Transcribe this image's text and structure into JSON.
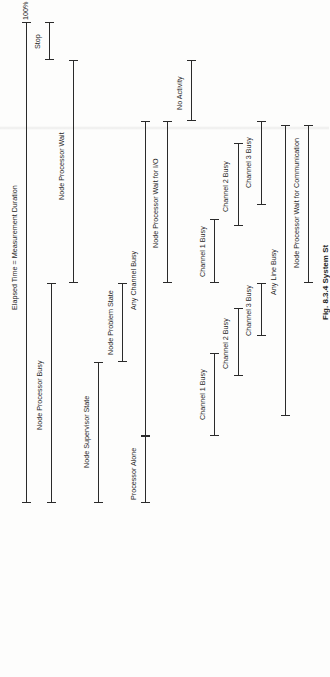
{
  "figure": {
    "caption": "Fig. 8.3.4  System St",
    "top_marker": "100%"
  },
  "bars": [
    {
      "id": "elapsed",
      "label": "Elapsed Time = Measurement Duration",
      "x": 26,
      "y1": 22,
      "y2": 503,
      "label_x": 15,
      "label_y": 310
    },
    {
      "id": "stop",
      "label": "Stop",
      "x": 49,
      "y1": 22,
      "y2": 60,
      "label_x": 38,
      "label_y": 49
    },
    {
      "id": "node-processor-busy",
      "label": "Node Processor Busy",
      "x": 51,
      "y1": 283,
      "y2": 503,
      "label_x": 40,
      "label_y": 430
    },
    {
      "id": "node-processor-wait",
      "label": "Node Processor Wait",
      "x": 73,
      "y1": 60,
      "y2": 283,
      "label_x": 62,
      "label_y": 200
    },
    {
      "id": "node-supervisor-state",
      "label": "Node Supervisor State",
      "x": 98,
      "y1": 362,
      "y2": 503,
      "label_x": 87,
      "label_y": 468
    },
    {
      "id": "node-problem-state",
      "label": "Node Problem State",
      "x": 122,
      "y1": 283,
      "y2": 362,
      "label_x": 111,
      "label_y": 355
    },
    {
      "id": "any-channel-busy",
      "label": "Any Channel Busy",
      "x": 145,
      "y1": 121,
      "y2": 436,
      "label_x": 134,
      "label_y": 310
    },
    {
      "id": "processor-alone",
      "label": "Processor Alone",
      "x": 145,
      "y1": 436,
      "y2": 503,
      "label_x": 134,
      "label_y": 500
    },
    {
      "id": "node-processor-wait-io",
      "label": "Node Processor Wait for I/O",
      "x": 167,
      "y1": 121,
      "y2": 283,
      "label_x": 156,
      "label_y": 248
    },
    {
      "id": "no-activity",
      "label": "No Activity",
      "x": 191,
      "y1": 60,
      "y2": 121,
      "label_x": 180,
      "label_y": 110
    },
    {
      "id": "channel-1-busy-a",
      "label": "Channel 1 Busy",
      "x": 214,
      "y1": 219,
      "y2": 283,
      "label_x": 203,
      "label_y": 277
    },
    {
      "id": "channel-1-busy-b",
      "label": "Channel 1 Busy",
      "x": 214,
      "y1": 353,
      "y2": 436,
      "label_x": 203,
      "label_y": 420
    },
    {
      "id": "channel-2-busy-a",
      "label": "Channel 2 Busy",
      "x": 238,
      "y1": 143,
      "y2": 226,
      "label_x": 226,
      "label_y": 212
    },
    {
      "id": "channel-2-busy-b",
      "label": "Channel 2 Busy",
      "x": 238,
      "y1": 308,
      "y2": 376,
      "label_x": 226,
      "label_y": 369
    },
    {
      "id": "channel-3-busy-a",
      "label": "Channel 3 Busy",
      "x": 261,
      "y1": 121,
      "y2": 205,
      "label_x": 249,
      "label_y": 188
    },
    {
      "id": "channel-3-busy-b",
      "label": "Channel 3 Busy",
      "x": 261,
      "y1": 283,
      "y2": 336,
      "label_x": 249,
      "label_y": 336
    },
    {
      "id": "any-line-busy",
      "label": "Any Line Busy",
      "x": 285,
      "y1": 125,
      "y2": 416,
      "label_x": 274,
      "label_y": 295
    },
    {
      "id": "node-processor-wait-comm",
      "label": "Node Processor Wait for Communication",
      "x": 308,
      "y1": 125,
      "y2": 283,
      "label_x": 297,
      "label_y": 268
    }
  ]
}
